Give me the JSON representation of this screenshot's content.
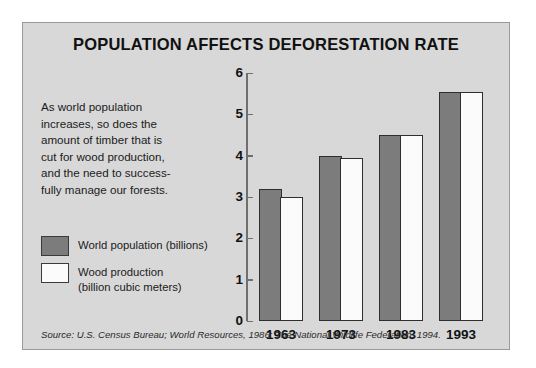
{
  "chart_data": {
    "type": "bar",
    "title": "POPULATION AFFECTS DEFORESTATION RATE",
    "categories": [
      "1963",
      "1973",
      "1983",
      "1993"
    ],
    "series": [
      {
        "name": "World population (billions)",
        "color": "#7c7c7c",
        "values": [
          3.2,
          4.0,
          4.5,
          5.55
        ]
      },
      {
        "name": "Wood production (billion cubic meters)",
        "color": "#fbfbfb",
        "values": [
          3.0,
          3.95,
          4.5,
          5.55
        ]
      }
    ],
    "xlabel": "",
    "ylabel": "",
    "ylim": [
      0,
      6
    ],
    "yticks": [
      "0",
      "1",
      "2",
      "3",
      "4",
      "5",
      "6"
    ],
    "grid": false,
    "legend_position": "left"
  },
  "description": {
    "lines": [
      "As world population",
      "increases, so does the",
      "amount of timber that is",
      "cut for wood production,",
      "and the need to success-",
      "fully manage our forests."
    ]
  },
  "legend": {
    "items": [
      {
        "label_lines": [
          "World population (billions)"
        ]
      },
      {
        "label_lines": [
          "Wood production",
          "(billion cubic meters)"
        ]
      }
    ]
  },
  "source": {
    "text": "Source: U.S. Census Bureau; World Resources, 1986; The National Wildlife Federation, 1994."
  }
}
